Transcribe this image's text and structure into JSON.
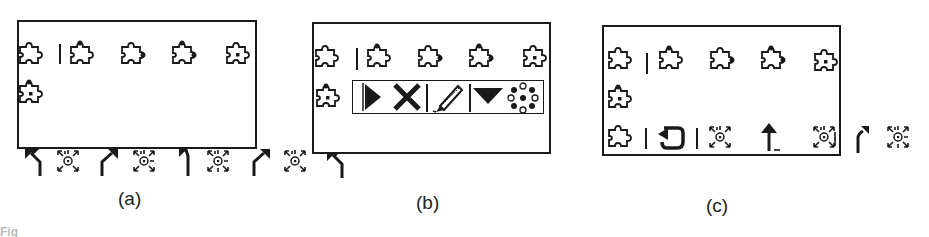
{
  "figure": {
    "panels": [
      {
        "id": "a",
        "caption": "(a)",
        "row1": [
          "puzzle-plain",
          "separator",
          "puzzle-top-knob",
          "puzzle-right-knob",
          "puzzle-top-right-knob",
          "puzzle-center-dot"
        ],
        "row2": [
          "puzzle-top-center-dot"
        ],
        "below_box": [
          "arrow-up-left",
          "sun-burst",
          "arrow-up-right",
          "sun-burst-dash",
          "arrow-up-left",
          "sun-burst-dash",
          "arrow-up-right",
          "sun-burst",
          "arrow-up-left"
        ]
      },
      {
        "id": "b",
        "caption": "(b)",
        "row1": [
          "puzzle-plain",
          "separator",
          "puzzle-top-knob",
          "puzzle-right-knob",
          "puzzle-top-right-knob",
          "puzzle-center-dot"
        ],
        "row2": [
          "puzzle-top-center-dot"
        ],
        "palette": [
          "play-triangle",
          "cross-x",
          "separator",
          "pencil",
          "down-triangle",
          "dot-ring"
        ],
        "below_box": [
          "arrow-up-left"
        ]
      },
      {
        "id": "c",
        "caption": "(c)",
        "row1": [
          "puzzle-plain",
          "separator",
          "puzzle-top-knob",
          "puzzle-right-knob",
          "puzzle-top-right-knob",
          "puzzle-center-dot"
        ],
        "row2": [
          "puzzle-top-center-dot"
        ],
        "row3": [
          "puzzle-plain",
          "separator",
          "loop-arrow",
          "separator",
          "sun-burst",
          "arrow-up-underscore",
          "sun-burst-edge"
        ],
        "outside_right": [
          "arrow-up-bent",
          "sun-burst-dash"
        ]
      }
    ],
    "footer_fragment": "Fig"
  }
}
